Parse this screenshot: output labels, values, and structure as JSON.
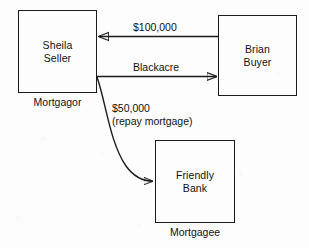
{
  "diagram": {
    "stroke_color": "#1b1b1b",
    "background_color": "#fdfdfd",
    "nodes": [
      {
        "id": "seller",
        "label": "Sheila\nSeller",
        "caption": "Mortgagor",
        "x": 18,
        "y": 10,
        "w": 79,
        "h": 83
      },
      {
        "id": "buyer",
        "label": "Brian\nBuyer",
        "caption": "",
        "x": 218,
        "y": 15,
        "w": 79,
        "h": 81
      },
      {
        "id": "bank",
        "label": "Friendly\nBank",
        "caption": "Mortgagee",
        "x": 155,
        "y": 140,
        "w": 80,
        "h": 83
      }
    ],
    "edges": [
      {
        "id": "payment",
        "label": "$100,000",
        "from": "buyer",
        "to": "seller",
        "direction": "left",
        "shape": "straight"
      },
      {
        "id": "deed",
        "label": "Blackacre",
        "from": "seller",
        "to": "buyer",
        "direction": "right",
        "shape": "straight"
      },
      {
        "id": "repayment",
        "label": "$50,000\n(repay mortgage)",
        "from": "seller",
        "to": "bank",
        "direction": "down-right",
        "shape": "curved"
      }
    ]
  }
}
